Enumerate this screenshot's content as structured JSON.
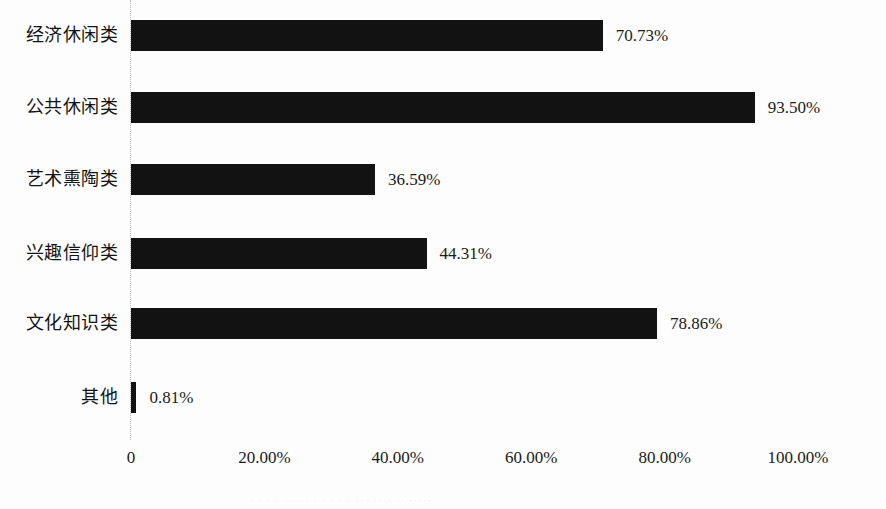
{
  "chart_data": {
    "type": "bar",
    "orientation": "horizontal",
    "title": "",
    "subtitle": "",
    "xlabel": "",
    "ylabel": "",
    "xlim": [
      0,
      100
    ],
    "grid": false,
    "legend": null,
    "categories": [
      "经济休闲类",
      "公共休闲类",
      "艺术熏陶类",
      "兴趣信仰类",
      "文化知识类",
      "其他"
    ],
    "values": [
      70.73,
      93.5,
      36.59,
      44.31,
      78.86,
      0.81
    ],
    "value_labels": [
      "70.73%",
      "93.50%",
      "36.59%",
      "44.31%",
      "78.86%",
      "0.81%"
    ],
    "x_ticks": [
      0,
      20,
      40,
      60,
      80,
      100
    ],
    "x_tick_labels": [
      "0",
      "20.00%",
      "40.00%",
      "60.00%",
      "80.00%",
      "100.00%"
    ],
    "bar_color": "#121212",
    "axis_color": "#b9b9b9",
    "background_color": "#fdfdfd",
    "text_color": "#1b1b1b"
  },
  "rows": [
    {
      "label": "经济休闲类",
      "value": 70.73,
      "value_label": "70.73%"
    },
    {
      "label": "公共休闲类",
      "value": 93.5,
      "value_label": "93.50%"
    },
    {
      "label": "艺术熏陶类",
      "value": 36.59,
      "value_label": "36.59%"
    },
    {
      "label": "兴趣信仰类",
      "value": 44.31,
      "value_label": "44.31%"
    },
    {
      "label": "文化知识类",
      "value": 78.86,
      "value_label": "78.86%"
    },
    {
      "label": "其他",
      "value": 0.81,
      "value_label": "0.81%"
    }
  ],
  "x_axis": {
    "ticks": [
      {
        "value": 0,
        "label": "0"
      },
      {
        "value": 20,
        "label": "20.00%"
      },
      {
        "value": 40,
        "label": "40.00%"
      },
      {
        "value": 60,
        "label": "60.00%"
      },
      {
        "value": 80,
        "label": "80.00%"
      },
      {
        "value": 100,
        "label": "100.00%"
      }
    ]
  },
  "footer": {
    "artifact_text": "· ·  ·   ·   ·    ·  ·· ·  ·  ·  · ·  ···  ····  ··  ·····"
  }
}
